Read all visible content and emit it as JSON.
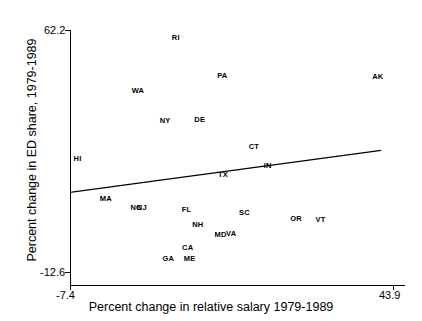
{
  "chart_data": {
    "type": "scatter",
    "title": "",
    "xlabel": "Percent change in relative salary 1979-1989",
    "ylabel": "Percent change in ED share, 1979-1989",
    "xlim": [
      -7.4,
      43.9
    ],
    "ylim": [
      -12.6,
      62.2
    ],
    "xticks": [
      "-7.4",
      "43.9"
    ],
    "yticks": [
      "-12.6",
      "62.2"
    ],
    "grid": false,
    "legend": "none",
    "point_label_field": "state",
    "points": [
      {
        "state": "RI",
        "x": 9.4,
        "y": 60.0
      },
      {
        "state": "AK",
        "x": 41.5,
        "y": 48.0
      },
      {
        "state": "PA",
        "x": 16.8,
        "y": 48.3
      },
      {
        "state": "WA",
        "x": 3.4,
        "y": 43.6
      },
      {
        "state": "NY",
        "x": 7.7,
        "y": 34.4
      },
      {
        "state": "DE",
        "x": 13.2,
        "y": 34.7
      },
      {
        "state": "CT",
        "x": 21.8,
        "y": 26.3
      },
      {
        "state": "HI",
        "x": -6.2,
        "y": 22.6
      },
      {
        "state": "IN",
        "x": 24.0,
        "y": 20.5
      },
      {
        "state": "TX",
        "x": 16.9,
        "y": 17.6
      },
      {
        "state": "MA",
        "x": -1.7,
        "y": 10.3
      },
      {
        "state": "NC",
        "x": 3.1,
        "y": 7.6
      },
      {
        "state": "NJ",
        "x": 4.0,
        "y": 7.6
      },
      {
        "state": "FL",
        "x": 11.1,
        "y": 6.8
      },
      {
        "state": "SC",
        "x": 20.3,
        "y": 6.0
      },
      {
        "state": "OR",
        "x": 28.5,
        "y": 4.0
      },
      {
        "state": "VT",
        "x": 32.4,
        "y": 3.7
      },
      {
        "state": "NH",
        "x": 12.9,
        "y": 2.3
      },
      {
        "state": "MD",
        "x": 16.5,
        "y": -0.8
      },
      {
        "state": "VA",
        "x": 18.2,
        "y": -0.5
      },
      {
        "state": "CA",
        "x": 11.3,
        "y": -5.0
      },
      {
        "state": "GA",
        "x": 8.2,
        "y": -8.4
      },
      {
        "state": "ME",
        "x": 11.6,
        "y": -8.4
      }
    ],
    "trendline": {
      "visible": true,
      "x_start": -7.4,
      "y_start": 12.0,
      "x_end": 42.0,
      "y_end": 25.0
    }
  },
  "axes": {
    "x": {
      "title": "Percent change in relative salary 1979-1989",
      "min_label": "-7.4",
      "max_label": "43.9"
    },
    "y": {
      "title": "Percent change in ED share, 1979-1989",
      "min_label": "-12.6",
      "max_label": "62.2"
    }
  }
}
